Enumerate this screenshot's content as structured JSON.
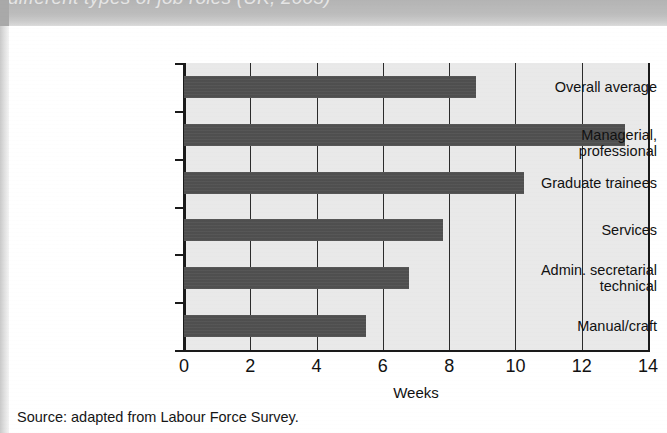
{
  "caption": {
    "text": "different types of job roles (UK, 2003)"
  },
  "source_note": "Source: adapted from Labour Force Survey.",
  "chart_data": {
    "type": "bar",
    "orientation": "horizontal",
    "title": "",
    "xlabel": "Weeks",
    "ylabel": "",
    "xlim": [
      0,
      14
    ],
    "xticks": [
      0,
      2,
      4,
      6,
      8,
      10,
      12,
      14
    ],
    "grid": true,
    "legend": "none",
    "bar_color": "#4f4f4f",
    "plot_background": "#e9e9e9",
    "categories": [
      "Overall average",
      "Managerial, professional",
      "Graduate trainees",
      "Services",
      "Admin. secretarial technical",
      "Manual/craft"
    ],
    "values": [
      8.8,
      13.3,
      10.25,
      7.8,
      6.8,
      5.5
    ]
  },
  "categories_display": [
    {
      "line1": "Overall average",
      "line2": ""
    },
    {
      "line1": "Managerial, professional",
      "line2": ""
    },
    {
      "line1": "Graduate trainees",
      "line2": ""
    },
    {
      "line1": "Services",
      "line2": ""
    },
    {
      "line1": "Admin. secretarial",
      "line2": "technical"
    },
    {
      "line1": "Manual/craft",
      "line2": ""
    }
  ]
}
